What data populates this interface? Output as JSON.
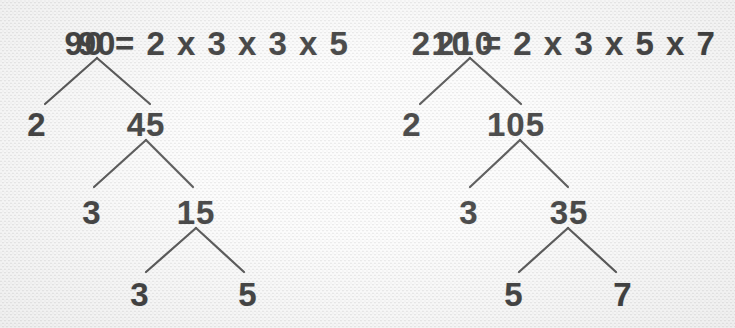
{
  "figure": {
    "background_color": "#efefef",
    "ink_color": "#111111",
    "line_color": "#2b2b2b"
  },
  "trees": [
    {
      "id": "tree-90",
      "equation": "90 = 2 x 3 x 3 x 5",
      "equation_x": 207,
      "equation_y": 27,
      "number": "90",
      "factors": [
        "2",
        "3",
        "3",
        "5"
      ],
      "nodes": [
        {
          "name": "root-90",
          "label": "90",
          "x": 97,
          "y": 27,
          "kind": "root"
        },
        {
          "name": "leaf-2",
          "label": "2",
          "x": 37,
          "y": 108,
          "kind": "leaf"
        },
        {
          "name": "branch-45",
          "label": "45",
          "x": 146,
          "y": 108,
          "kind": "branch"
        },
        {
          "name": "leaf-3-a",
          "label": "3",
          "x": 92,
          "y": 196,
          "kind": "leaf"
        },
        {
          "name": "branch-15",
          "label": "15",
          "x": 196,
          "y": 196,
          "kind": "branch"
        },
        {
          "name": "leaf-3-b",
          "label": "3",
          "x": 140,
          "y": 278,
          "kind": "leaf"
        },
        {
          "name": "leaf-5",
          "label": "5",
          "x": 248,
          "y": 278,
          "kind": "leaf"
        }
      ],
      "branches": [
        {
          "name": "branch-90-to-2",
          "x1": 97,
          "y1": 58,
          "x2": 45,
          "y2": 104
        },
        {
          "name": "branch-90-to-45",
          "x1": 97,
          "y1": 58,
          "x2": 150,
          "y2": 104
        },
        {
          "name": "branch-45-to-3",
          "x1": 146,
          "y1": 140,
          "x2": 94,
          "y2": 187
        },
        {
          "name": "branch-45-to-15",
          "x1": 146,
          "y1": 140,
          "x2": 193,
          "y2": 187
        },
        {
          "name": "branch-15-to-3",
          "x1": 196,
          "y1": 228,
          "x2": 146,
          "y2": 272
        },
        {
          "name": "branch-15-to-5",
          "x1": 196,
          "y1": 228,
          "x2": 244,
          "y2": 272
        }
      ]
    },
    {
      "id": "tree-210",
      "equation": "210 = 2 x 3 x 5 x 7",
      "equation_x": 564,
      "equation_y": 27,
      "number": "210",
      "factors": [
        "2",
        "3",
        "5",
        "7"
      ],
      "nodes": [
        {
          "name": "root-210",
          "label": "210",
          "x": 465,
          "y": 27,
          "kind": "root"
        },
        {
          "name": "leaf-2",
          "label": "2",
          "x": 412,
          "y": 108,
          "kind": "leaf"
        },
        {
          "name": "branch-105",
          "label": "105",
          "x": 516,
          "y": 108,
          "kind": "branch"
        },
        {
          "name": "leaf-3",
          "label": "3",
          "x": 469,
          "y": 196,
          "kind": "leaf"
        },
        {
          "name": "branch-35",
          "label": "35",
          "x": 569,
          "y": 196,
          "kind": "branch"
        },
        {
          "name": "leaf-5",
          "label": "5",
          "x": 514,
          "y": 278,
          "kind": "leaf"
        },
        {
          "name": "leaf-7",
          "label": "7",
          "x": 623,
          "y": 278,
          "kind": "leaf"
        }
      ],
      "branches": [
        {
          "name": "branch-210-to-2",
          "x1": 470,
          "y1": 58,
          "x2": 420,
          "y2": 104
        },
        {
          "name": "branch-210-to-105",
          "x1": 470,
          "y1": 58,
          "x2": 521,
          "y2": 104
        },
        {
          "name": "branch-105-to-3",
          "x1": 520,
          "y1": 140,
          "x2": 470,
          "y2": 187
        },
        {
          "name": "branch-105-to-35",
          "x1": 520,
          "y1": 140,
          "x2": 568,
          "y2": 187
        },
        {
          "name": "branch-35-to-5",
          "x1": 568,
          "y1": 228,
          "x2": 519,
          "y2": 272
        },
        {
          "name": "branch-35-to-7",
          "x1": 568,
          "y1": 228,
          "x2": 616,
          "y2": 272
        }
      ]
    }
  ]
}
